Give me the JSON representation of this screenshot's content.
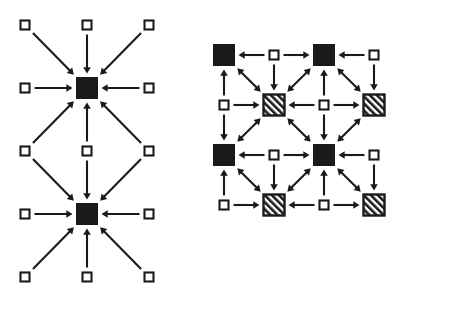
{
  "figure": {
    "title": "",
    "type": "node-arrow-diagram",
    "background_color": "#ffffff",
    "ink_color": "#1a1a1a",
    "panel_count": 2
  },
  "legend": {
    "node_kinds": [
      {
        "key": "small-open",
        "label": "small open square",
        "fill": "#ffffff",
        "stroke": "#1a1a1a",
        "size_px": 9
      },
      {
        "key": "filled",
        "label": "large filled square",
        "fill": "#1a1a1a",
        "stroke": "#1a1a1a",
        "size_px": 21
      },
      {
        "key": "hatched",
        "label": "large hatched square",
        "fill": "hatch-45",
        "stroke": "#1a1a1a",
        "size_px": 21
      }
    ],
    "edge_kinds": [
      {
        "key": "single",
        "label": "single-headed arrow"
      },
      {
        "key": "double",
        "label": "double-headed arrow"
      }
    ]
  },
  "panels": [
    {
      "id": "panel-left",
      "name": "left-diagram",
      "width": 195,
      "height": 315,
      "grid": {
        "cols": 3,
        "rows": 5,
        "x0": 25,
        "y0": 25,
        "dx": 62,
        "dy": 63
      },
      "nodes": [
        {
          "id": "L00",
          "col": 0,
          "row": 0,
          "kind": "small-open"
        },
        {
          "id": "L10",
          "col": 1,
          "row": 0,
          "kind": "small-open"
        },
        {
          "id": "L20",
          "col": 2,
          "row": 0,
          "kind": "small-open"
        },
        {
          "id": "L01",
          "col": 0,
          "row": 1,
          "kind": "small-open"
        },
        {
          "id": "L11",
          "col": 1,
          "row": 1,
          "kind": "filled"
        },
        {
          "id": "L21",
          "col": 2,
          "row": 1,
          "kind": "small-open"
        },
        {
          "id": "L02",
          "col": 0,
          "row": 2,
          "kind": "small-open"
        },
        {
          "id": "L12",
          "col": 1,
          "row": 2,
          "kind": "small-open"
        },
        {
          "id": "L22",
          "col": 2,
          "row": 2,
          "kind": "small-open"
        },
        {
          "id": "L03",
          "col": 0,
          "row": 3,
          "kind": "small-open"
        },
        {
          "id": "L13",
          "col": 1,
          "row": 3,
          "kind": "filled"
        },
        {
          "id": "L23",
          "col": 2,
          "row": 3,
          "kind": "small-open"
        },
        {
          "id": "L04",
          "col": 0,
          "row": 4,
          "kind": "small-open"
        },
        {
          "id": "L14",
          "col": 1,
          "row": 4,
          "kind": "small-open"
        },
        {
          "id": "L24",
          "col": 2,
          "row": 4,
          "kind": "small-open"
        }
      ],
      "edges": [
        {
          "from": "L00",
          "to": "L11",
          "heads": "single"
        },
        {
          "from": "L10",
          "to": "L11",
          "heads": "single"
        },
        {
          "from": "L20",
          "to": "L11",
          "heads": "single"
        },
        {
          "from": "L01",
          "to": "L11",
          "heads": "single"
        },
        {
          "from": "L21",
          "to": "L11",
          "heads": "single"
        },
        {
          "from": "L02",
          "to": "L11",
          "heads": "single"
        },
        {
          "from": "L12",
          "to": "L11",
          "heads": "single"
        },
        {
          "from": "L22",
          "to": "L11",
          "heads": "single"
        },
        {
          "from": "L02",
          "to": "L13",
          "heads": "single"
        },
        {
          "from": "L12",
          "to": "L13",
          "heads": "single"
        },
        {
          "from": "L22",
          "to": "L13",
          "heads": "single"
        },
        {
          "from": "L03",
          "to": "L13",
          "heads": "single"
        },
        {
          "from": "L23",
          "to": "L13",
          "heads": "single"
        },
        {
          "from": "L04",
          "to": "L13",
          "heads": "single"
        },
        {
          "from": "L14",
          "to": "L13",
          "heads": "single"
        },
        {
          "from": "L24",
          "to": "L13",
          "heads": "single"
        }
      ]
    },
    {
      "id": "panel-right",
      "name": "right-diagram",
      "width": 255,
      "height": 315,
      "grid": {
        "cols": 5,
        "rows": 5,
        "x0": 29,
        "y0": 55,
        "dx": 50,
        "dy": 50
      },
      "nodes": [
        {
          "id": "R00",
          "col": 0,
          "row": 0,
          "kind": "filled"
        },
        {
          "id": "R10",
          "col": 1,
          "row": 0,
          "kind": "small-open"
        },
        {
          "id": "R20",
          "col": 2,
          "row": 0,
          "kind": "filled"
        },
        {
          "id": "R30",
          "col": 3,
          "row": 0,
          "kind": "small-open"
        },
        {
          "id": "R01",
          "col": 0,
          "row": 1,
          "kind": "small-open"
        },
        {
          "id": "R11",
          "col": 1,
          "row": 1,
          "kind": "hatched"
        },
        {
          "id": "R21",
          "col": 2,
          "row": 1,
          "kind": "small-open"
        },
        {
          "id": "R31",
          "col": 3,
          "row": 1,
          "kind": "hatched"
        },
        {
          "id": "R02",
          "col": 0,
          "row": 2,
          "kind": "filled"
        },
        {
          "id": "R12",
          "col": 1,
          "row": 2,
          "kind": "small-open"
        },
        {
          "id": "R22",
          "col": 2,
          "row": 2,
          "kind": "filled"
        },
        {
          "id": "R32",
          "col": 3,
          "row": 2,
          "kind": "small-open"
        },
        {
          "id": "R03",
          "col": 0,
          "row": 3,
          "kind": "small-open"
        },
        {
          "id": "R13",
          "col": 1,
          "row": 3,
          "kind": "hatched"
        },
        {
          "id": "R23",
          "col": 2,
          "row": 3,
          "kind": "small-open"
        },
        {
          "id": "R33",
          "col": 3,
          "row": 3,
          "kind": "hatched"
        }
      ],
      "edges": [
        {
          "from": "R10",
          "to": "R00",
          "heads": "single"
        },
        {
          "from": "R10",
          "to": "R20",
          "heads": "single"
        },
        {
          "from": "R30",
          "to": "R20",
          "heads": "single"
        },
        {
          "from": "R01",
          "to": "R00",
          "heads": "single"
        },
        {
          "from": "R10",
          "to": "R11",
          "heads": "single"
        },
        {
          "from": "R21",
          "to": "R20",
          "heads": "single"
        },
        {
          "from": "R30",
          "to": "R31",
          "heads": "single"
        },
        {
          "from": "R00",
          "to": "R11",
          "heads": "double"
        },
        {
          "from": "R20",
          "to": "R11",
          "heads": "double"
        },
        {
          "from": "R20",
          "to": "R31",
          "heads": "double"
        },
        {
          "from": "R01",
          "to": "R11",
          "heads": "single"
        },
        {
          "from": "R21",
          "to": "R11",
          "heads": "single"
        },
        {
          "from": "R21",
          "to": "R31",
          "heads": "single"
        },
        {
          "from": "R01",
          "to": "R02",
          "heads": "single"
        },
        {
          "from": "R21",
          "to": "R22",
          "heads": "single"
        },
        {
          "from": "R02",
          "to": "R11",
          "heads": "double"
        },
        {
          "from": "R22",
          "to": "R11",
          "heads": "double"
        },
        {
          "from": "R22",
          "to": "R31",
          "heads": "double"
        },
        {
          "from": "R12",
          "to": "R02",
          "heads": "single"
        },
        {
          "from": "R12",
          "to": "R22",
          "heads": "single"
        },
        {
          "from": "R32",
          "to": "R22",
          "heads": "single"
        },
        {
          "from": "R03",
          "to": "R02",
          "heads": "single"
        },
        {
          "from": "R12",
          "to": "R13",
          "heads": "single"
        },
        {
          "from": "R23",
          "to": "R22",
          "heads": "single"
        },
        {
          "from": "R32",
          "to": "R33",
          "heads": "single"
        },
        {
          "from": "R02",
          "to": "R13",
          "heads": "double"
        },
        {
          "from": "R22",
          "to": "R13",
          "heads": "double"
        },
        {
          "from": "R22",
          "to": "R33",
          "heads": "double"
        },
        {
          "from": "R03",
          "to": "R13",
          "heads": "single"
        },
        {
          "from": "R23",
          "to": "R13",
          "heads": "single"
        },
        {
          "from": "R23",
          "to": "R33",
          "heads": "single"
        }
      ]
    }
  ]
}
